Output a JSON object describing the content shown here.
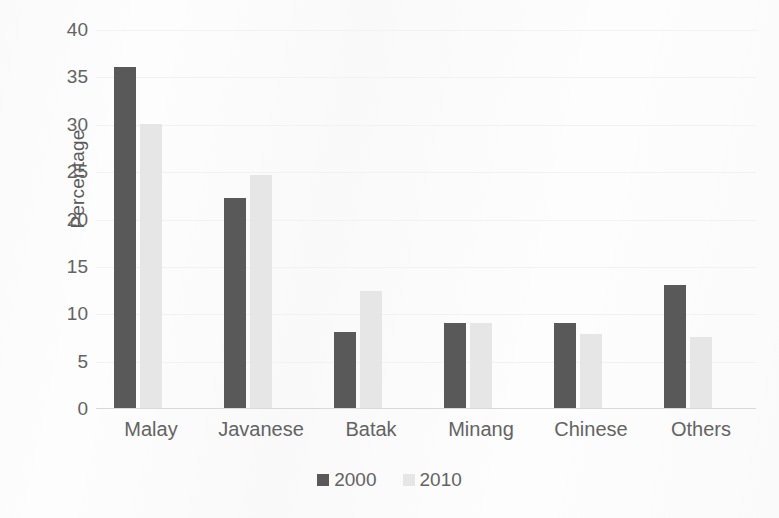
{
  "chart_data": {
    "type": "bar",
    "title": "",
    "subtitle": "",
    "xlabel": "",
    "ylabel": "Percentage",
    "categories": [
      "Malay",
      "Javanese",
      "Batak",
      "Minang",
      "Chinese",
      "Others"
    ],
    "series": [
      {
        "name": "2000",
        "color": "#595959",
        "values": [
          36,
          22.2,
          8,
          9,
          9,
          13
        ]
      },
      {
        "name": "2010",
        "color": "#e6e6e6",
        "values": [
          30,
          24.6,
          12.3,
          9,
          7.8,
          7.5
        ]
      }
    ],
    "ylim": [
      0,
      40
    ],
    "ytick_values": [
      0,
      5,
      10,
      15,
      20,
      25,
      30,
      35,
      40
    ],
    "ytick_labels": [
      "0",
      "5",
      "10",
      "15",
      "20",
      "25",
      "30",
      "35",
      "40"
    ],
    "grid": true,
    "grid_axis": "y",
    "legend_position": "bottom",
    "legend_entries": [
      "2000",
      "2010"
    ]
  },
  "colors": {
    "series_2000": "#595959",
    "series_2010": "#e6e6e6",
    "text": "#636363",
    "gridline": "#f2f2f2",
    "background": "#fdfdfd"
  }
}
